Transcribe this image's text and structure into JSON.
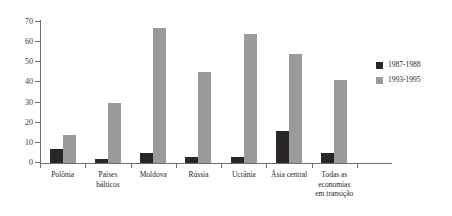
{
  "chart_data": {
    "type": "bar",
    "title": "",
    "subtitle": "",
    "xlabel": "",
    "ylabel": "",
    "ylim": [
      0,
      70
    ],
    "yticks": [
      0,
      10,
      20,
      30,
      40,
      50,
      60,
      70
    ],
    "grid": false,
    "legend_position": "right",
    "categories": [
      "Polônia",
      "Países bálticos",
      "Moldova",
      "Rússia",
      "Ucrânia",
      "Ásia central",
      "Todas as economias em transição"
    ],
    "category_lines": [
      [
        "Polônia"
      ],
      [
        "Países",
        "bálticos"
      ],
      [
        "Moldova"
      ],
      [
        "Rússia"
      ],
      [
        "Ucrânia"
      ],
      [
        "Ásia central"
      ],
      [
        "Todas as",
        "economias",
        "em transição"
      ]
    ],
    "series": [
      {
        "name": "1987-1988",
        "color": "#2b2626",
        "values": [
          7,
          2,
          5,
          3,
          3,
          16,
          5
        ]
      },
      {
        "name": "1993-1995",
        "color": "#9a9a9a",
        "values": [
          14,
          30,
          67,
          45,
          64,
          54,
          41
        ]
      }
    ]
  },
  "legend": {
    "items": [
      {
        "label": "1987-1988",
        "color": "#2b2626"
      },
      {
        "label": "1993-1995",
        "color": "#9a9a9a"
      }
    ]
  },
  "artifact": {
    "top_text": ""
  }
}
